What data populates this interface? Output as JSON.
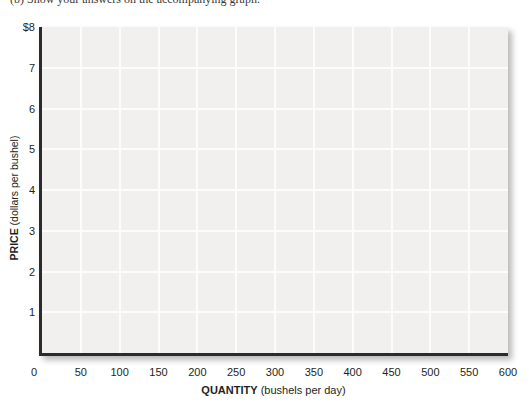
{
  "top_text": {
    "fragment": "(b) Show your answers on the accompanying graph."
  },
  "chart_data": {
    "type": "line",
    "title": "",
    "series": [],
    "xlabel_bold_part": "QUANTITY",
    "xlabel_regular_part": " (bushels per day)",
    "ylabel_bold_part": "PRICE",
    "ylabel_regular_part": " (dollars per bushel)",
    "x_ticks": [
      "0",
      "50",
      "100",
      "150",
      "200",
      "250",
      "300",
      "350",
      "400",
      "450",
      "500",
      "550",
      "600"
    ],
    "y_ticks": [
      "$8",
      "7",
      "6",
      "5",
      "4",
      "3",
      "2",
      "1"
    ],
    "origin_label": "0",
    "xlim": [
      0,
      600
    ],
    "ylim": [
      0,
      8
    ],
    "x_grid_interval": 50,
    "y_grid_interval": 1,
    "grid": true,
    "legend": null
  },
  "colors": {
    "page_background": "#ffffff",
    "plot_background": "#f1f0ee",
    "gridline": "#fcfcfb",
    "axis": "#2b2b2b",
    "text": "#231f20"
  }
}
